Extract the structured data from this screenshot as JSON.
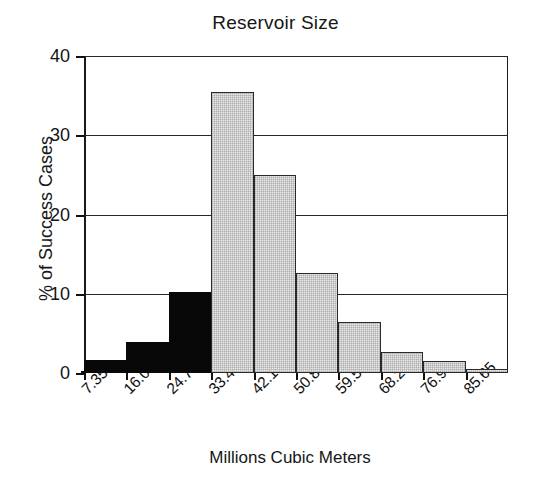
{
  "chart_data": {
    "type": "bar",
    "title": "Reservoir Size",
    "xlabel": "Millions Cubic Meters",
    "ylabel": "% of Success Cases",
    "categories": [
      "7.35",
      "16.05",
      "24.75",
      "33.45",
      "42.15",
      "50.85",
      "59.55",
      "68.25",
      "76.95",
      "85.65"
    ],
    "values": [
      1.6,
      3.9,
      10.2,
      35.5,
      25.0,
      12.6,
      6.4,
      2.6,
      1.5,
      0.5
    ],
    "series": [
      {
        "name": "Success Cases",
        "values": [
          1.6,
          3.9,
          10.2,
          35.5,
          25.0,
          12.6,
          6.4,
          2.6,
          1.5,
          0.5
        ],
        "fills": [
          "black",
          "black",
          "black",
          "gray",
          "gray",
          "gray",
          "gray",
          "gray",
          "gray",
          "gray"
        ]
      }
    ],
    "ylim": [
      0,
      40
    ],
    "yticks": [
      0,
      10,
      20,
      30,
      40
    ],
    "ytick_labels": [
      "0",
      "10",
      "20",
      "30",
      "40"
    ],
    "grid": true,
    "grid_axis": "y",
    "legend": "none",
    "bar_gap": 0,
    "colors": {
      "highlight_fill": "#080808",
      "bar_fill": "#e9e9e9",
      "bar_edge": "#2a2a2a",
      "axis": "#111111",
      "text": "#131313",
      "background": "#ffffff"
    },
    "xtick_label_rotation": -45
  }
}
